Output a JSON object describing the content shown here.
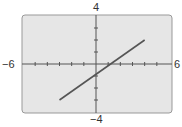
{
  "chart_data": {
    "type": "line",
    "title": "",
    "xlabel": "",
    "ylabel": "",
    "xlim": [
      -6,
      6
    ],
    "ylim": [
      -4,
      4
    ],
    "xscale": 1,
    "yscale": 1,
    "grid": false,
    "tick_labels": {
      "xmin": "−6",
      "xmax": "6",
      "ymax": "4",
      "ymin": "−4"
    },
    "series": [
      {
        "name": "line",
        "x": [
          -3,
          4
        ],
        "y": [
          -3,
          2
        ],
        "color": "#555555"
      }
    ],
    "screen_background": "#e6e6e6",
    "frame_color": "#888888"
  }
}
